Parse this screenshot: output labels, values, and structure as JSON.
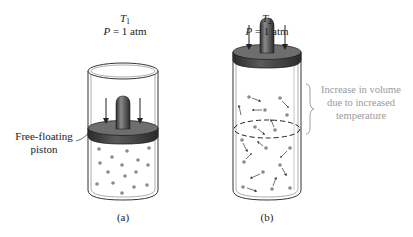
{
  "panel_a": {
    "temperature_symbol": "T",
    "temperature_subscript": "1",
    "pressure_symbol": "P",
    "pressure_value": " = 1 atm",
    "callout_line1": "Free-floating",
    "callout_line2": "piston",
    "caption": "(a)"
  },
  "panel_b": {
    "temperature_symbol": "T",
    "temperature_subscript": "2",
    "pressure_symbol": "P",
    "pressure_value": " = 1 atm",
    "annotation_line1": "Increase in volume",
    "annotation_line2": "due to increased",
    "annotation_line3": "temperature",
    "caption": "(b)"
  },
  "colors": {
    "piston_dark": "#3a3a3a",
    "piston_top": "#6e6e6e",
    "particle": "#8a8a8a",
    "annotation_text": "#9a9a9a",
    "outline": "#333333"
  }
}
